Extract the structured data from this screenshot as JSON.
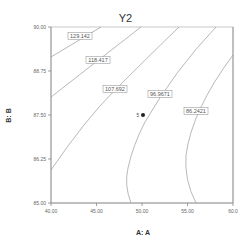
{
  "chart_data": {
    "type": "contour",
    "title": "Y2",
    "xlabel": "A: A",
    "ylabel": "B: B",
    "xlim": [
      40.0,
      60.0
    ],
    "ylim": [
      85.0,
      90.0
    ],
    "x_ticks": [
      "40.00",
      "45.00",
      "50.00",
      "55.00",
      "60.0"
    ],
    "y_ticks": [
      "85.00",
      "86.25",
      "87.50",
      "88.75",
      "90.00"
    ],
    "grid": false,
    "contours": [
      {
        "level": "129.142",
        "points": [
          [
            40.0,
            89.2
          ],
          [
            45.5,
            90.0
          ]
        ]
      },
      {
        "level": "118.417",
        "points": [
          [
            40.0,
            88.1
          ],
          [
            50.0,
            90.0
          ]
        ]
      },
      {
        "level": "107.692",
        "points": [
          [
            40.0,
            86.0
          ],
          [
            47.0,
            87.5
          ],
          [
            54.1,
            90.0
          ]
        ]
      },
      {
        "level": "96.9671",
        "points": [
          [
            48.8,
            85.0
          ],
          [
            48.5,
            86.0
          ],
          [
            50.0,
            87.2
          ],
          [
            52.0,
            88.2
          ],
          [
            58.3,
            90.0
          ]
        ]
      },
      {
        "level": "86.2421",
        "points": [
          [
            56.0,
            85.0
          ],
          [
            54.9,
            86.4
          ],
          [
            56.5,
            87.9
          ],
          [
            60.0,
            89.2
          ]
        ]
      }
    ],
    "design_points": [
      {
        "x": 50.0,
        "y": 87.5,
        "label": "5"
      }
    ]
  }
}
